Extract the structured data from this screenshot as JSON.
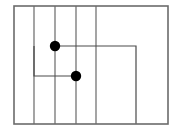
{
  "canvas": {
    "width": 182,
    "height": 131,
    "background": "#ffffff"
  },
  "diagram": {
    "title": "",
    "type": "schematic-line-diagram",
    "stroke_color_border": "#6b6b6b",
    "stroke_color_inner": "#5a5a5a",
    "stroke_color_path": "#4a4a4a",
    "node_color": "#000000",
    "border": {
      "x": 14,
      "y": 6,
      "width": 154,
      "height": 118,
      "stroke_width": 1.6
    },
    "vertical_lines": [
      {
        "name": "divider-1",
        "x": 34,
        "y1": 6,
        "y2": 124
      },
      {
        "name": "divider-2",
        "x": 55,
        "y1": 6,
        "y2": 124
      },
      {
        "name": "divider-3",
        "x": 76,
        "y1": 6,
        "y2": 124
      },
      {
        "name": "divider-4",
        "x": 96,
        "y1": 6,
        "y2": 124
      }
    ],
    "paths": [
      {
        "name": "upper-branch",
        "points": "55,46 136,46 136,124"
      },
      {
        "name": "lower-branch",
        "points": "34,46 34,76 76,76"
      }
    ],
    "nodes": [
      {
        "name": "node-upper",
        "cx": 55,
        "cy": 46,
        "r": 5.2
      },
      {
        "name": "node-lower",
        "cx": 76,
        "cy": 76,
        "r": 5.2
      }
    ]
  }
}
